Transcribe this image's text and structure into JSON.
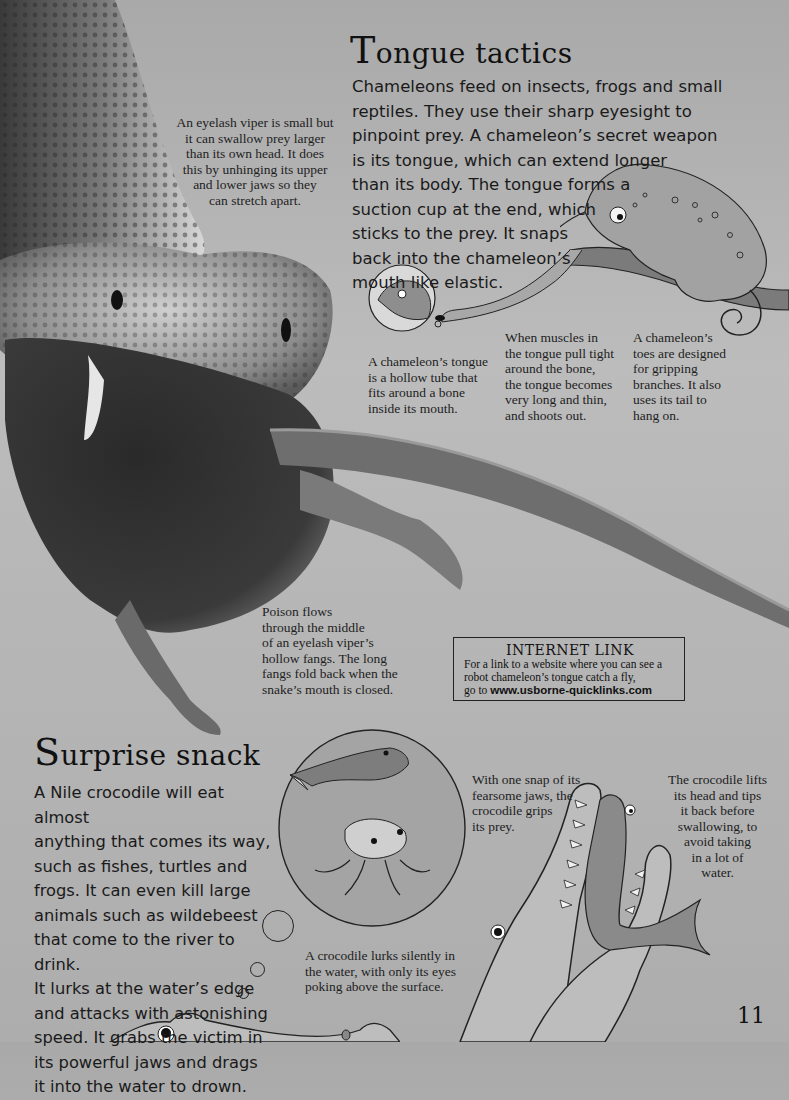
{
  "page": {
    "number": "11",
    "background_color": "#b5b5b5",
    "text_color": "#141414"
  },
  "tongue_section": {
    "heading_initial": "T",
    "heading_rest": "ongue tactics",
    "body": "Chameleons feed on insects, frogs and small\nreptiles. They use their sharp eyesight to\npinpoint prey. A chameleon’s secret weapon\nis its tongue, which can extend longer\nthan its body. The tongue forms a\nsuction cup at the end, which\nsticks to the prey. It snaps\nback into the chameleon’s\nmouth like elastic.",
    "captions": {
      "tongue_tube": "A chameleon’s tongue\nis a hollow tube that\nfits around a bone\ninside its mouth.",
      "muscles": "When muscles in\nthe tongue pull tight\naround the bone,\nthe tongue becomes\nvery long and thin,\nand shoots out.",
      "toes": "A chameleon’s\ntoes are designed\nfor gripping\nbranches. It also\nuses its tail to\nhang on."
    }
  },
  "viper_captions": {
    "swallow": "An eyelash viper is small but\nit can swallow prey larger\nthan its own head. It does\nthis by unhinging its upper\nand lower jaws so they\ncan stretch apart.",
    "poison": "Poison flows\nthrough the middle\nof an eyelash viper’s\nhollow fangs. The long\nfangs fold back when the\nsnake’s mouth is closed."
  },
  "internet_link": {
    "title": "INTERNET LINK",
    "body": "For a link to a website where you can see a\nrobot chameleon’s tongue catch a fly,\ngo to ",
    "url": "www.usborne-quicklinks.com"
  },
  "snack_section": {
    "heading_initial": "S",
    "heading_rest": "urprise snack",
    "body": "A Nile crocodile will eat almost\nanything that comes its way,\nsuch as fishes, turtles and\nfrogs. It can even kill large\nanimals such as wildebeest\nthat come to the river to drink.\nIt lurks at the water’s edge\nand attacks with astonishing\nspeed. It grabs the victim in\nits powerful jaws and drags\nit into the water to drown.",
    "captions": {
      "snap": "With one snap of its\nfearsome jaws, the\ncrocodile grips\nits prey.",
      "lifts": "The crocodile lifts\nits head and tips\nit back before\nswallowing, to\navoid taking\nin a lot of\nwater.",
      "lurks": "A crocodile lurks silently in\nthe water, with only its eyes\npoking above the surface."
    }
  },
  "illustrations": {
    "viper_photo": "eyelash viper swallowing a mouse",
    "chameleon": "chameleon on branch catching a fly",
    "tongue_inset": "chameleon tongue inset",
    "prey_bubble": "fish and frog in thought bubble",
    "crocodile_fish": "crocodile swallowing a fish",
    "crocodile_lurking": "crocodile eyes above water"
  }
}
